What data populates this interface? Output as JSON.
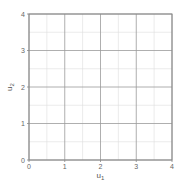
{
  "chart_data": {
    "type": "scatter",
    "title": "",
    "xlabel": "u",
    "xlabel_sub": "1",
    "ylabel": "u",
    "ylabel_sub": "2",
    "xlim": [
      0,
      4
    ],
    "ylim": [
      0,
      4
    ],
    "x_ticks": [
      0,
      1,
      2,
      3,
      4
    ],
    "y_ticks": [
      0,
      1,
      2,
      3,
      4
    ],
    "x_tick_labels": [
      "0",
      "1",
      "2",
      "3",
      "4"
    ],
    "y_tick_labels": [
      "0",
      "1",
      "2",
      "3",
      "4"
    ],
    "grid": true,
    "minor_grid_step": 0.5,
    "series": [],
    "legend": null
  },
  "colors": {
    "major_grid": "#9a9a9a",
    "minor_grid": "#dddddd",
    "axis": "#888888",
    "text": "#666666"
  }
}
